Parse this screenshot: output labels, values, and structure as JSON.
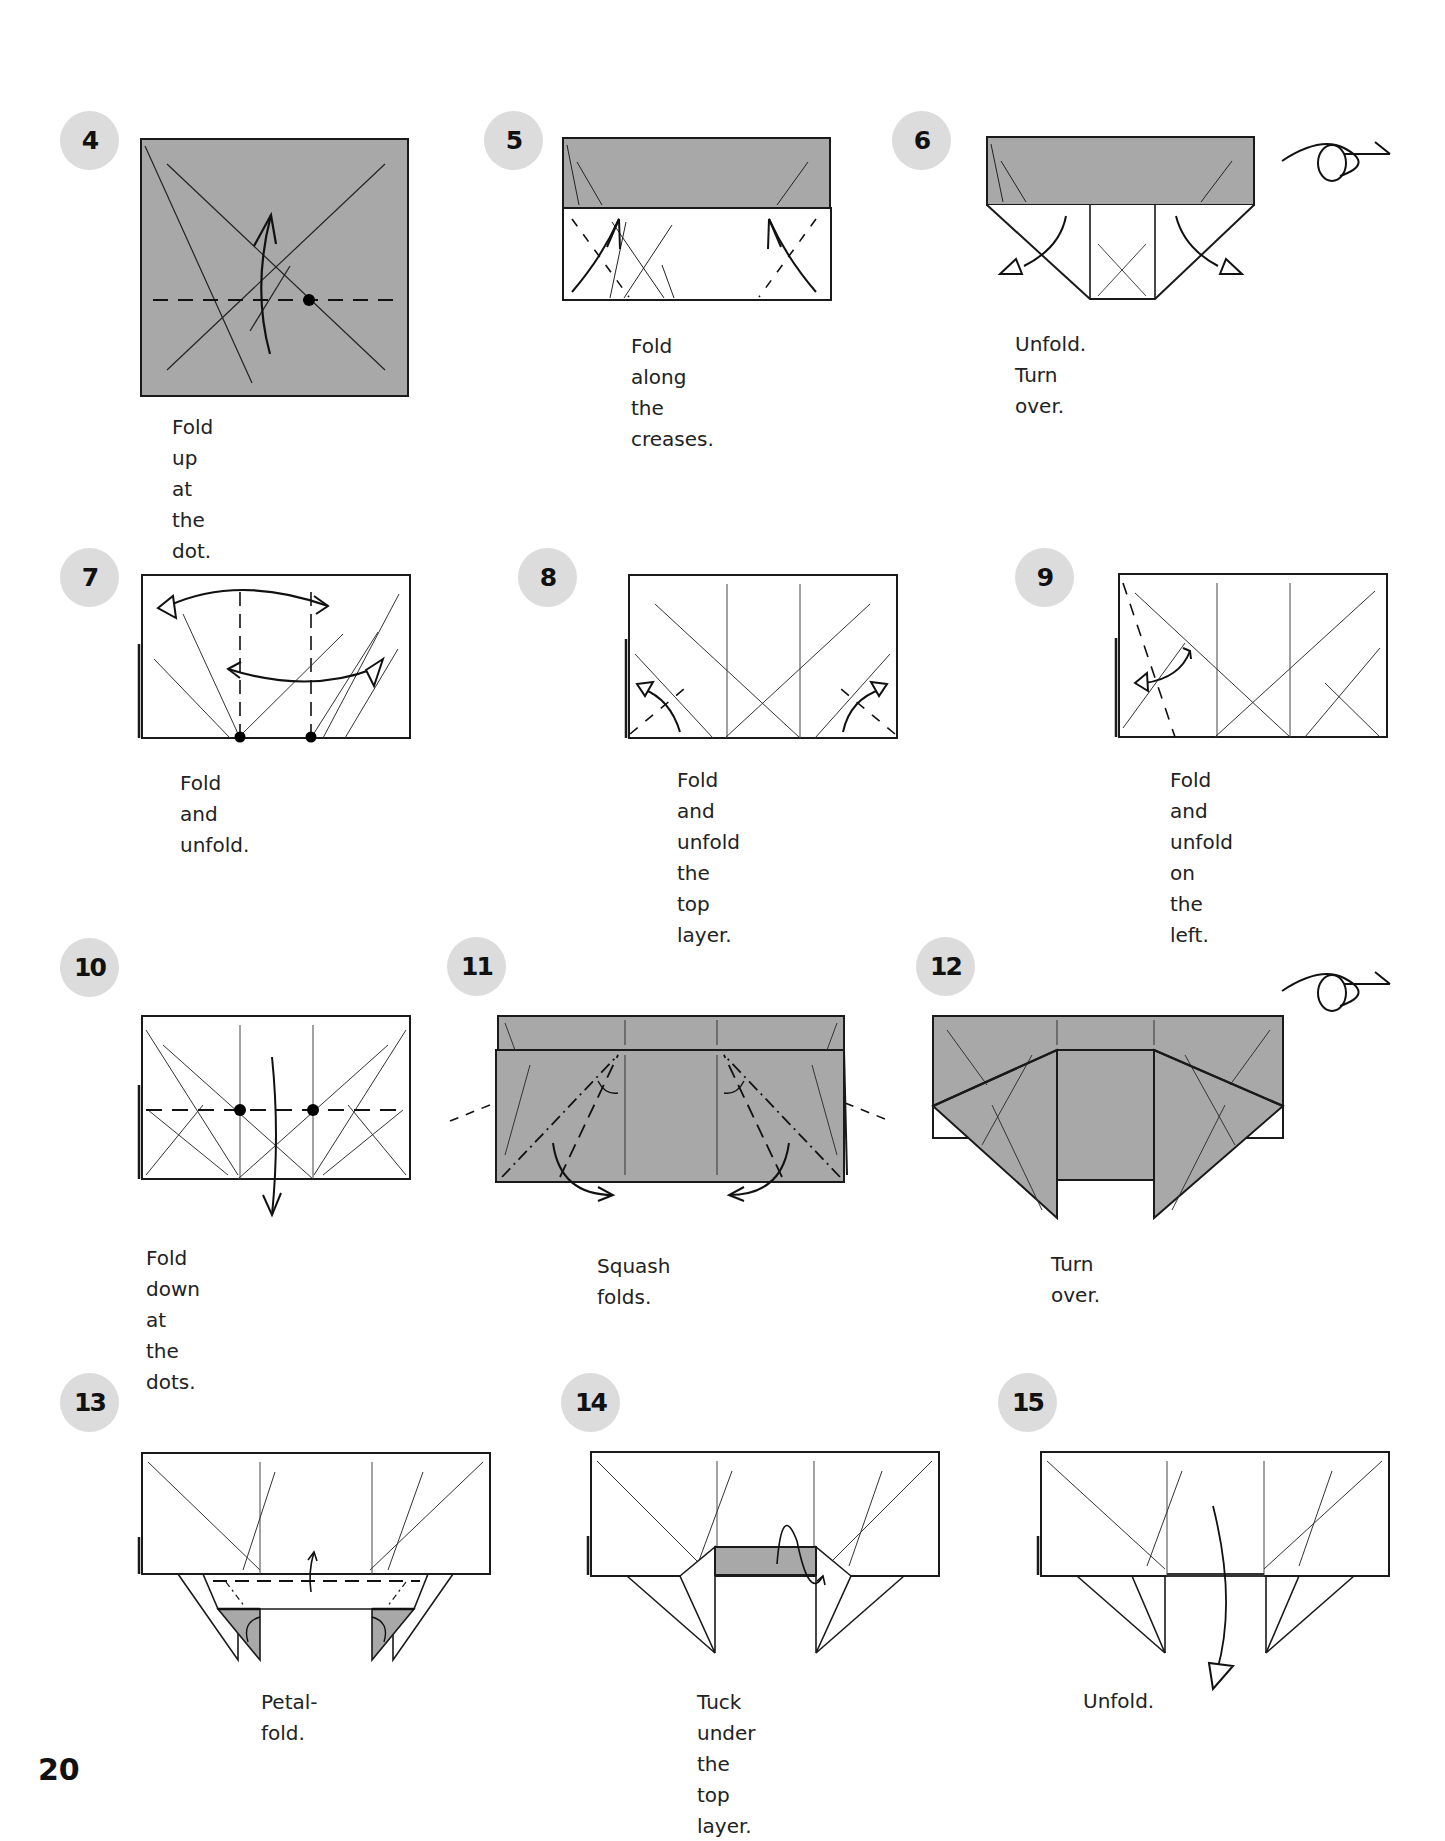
{
  "page": {
    "page_number": "20",
    "colors": {
      "paper_gray": "#a8a8a8",
      "badge_gray": "#dcdcdc",
      "line": "#1a1a1a"
    }
  },
  "steps": [
    {
      "number": "4",
      "caption": "Fold up at the dot."
    },
    {
      "number": "5",
      "caption": "Fold along\nthe creases."
    },
    {
      "number": "6",
      "caption": "Unfold. Turn over."
    },
    {
      "number": "7",
      "caption": "Fold and unfold."
    },
    {
      "number": "8",
      "caption": "Fold and unfold\nthe top layer."
    },
    {
      "number": "9",
      "caption": "Fold and unfold\non the left."
    },
    {
      "number": "10",
      "caption": "Fold down at the dots."
    },
    {
      "number": "11",
      "caption": "Squash folds."
    },
    {
      "number": "12",
      "caption": "Turn over."
    },
    {
      "number": "13",
      "caption": "Petal-fold."
    },
    {
      "number": "14",
      "caption": "Tuck under\nthe top layer."
    },
    {
      "number": "15",
      "caption": "Unfold."
    }
  ],
  "icons": {
    "turn_over": "turn-over-icon",
    "fold_arrow": "fold-arrow-icon",
    "dot": "reference-dot"
  }
}
